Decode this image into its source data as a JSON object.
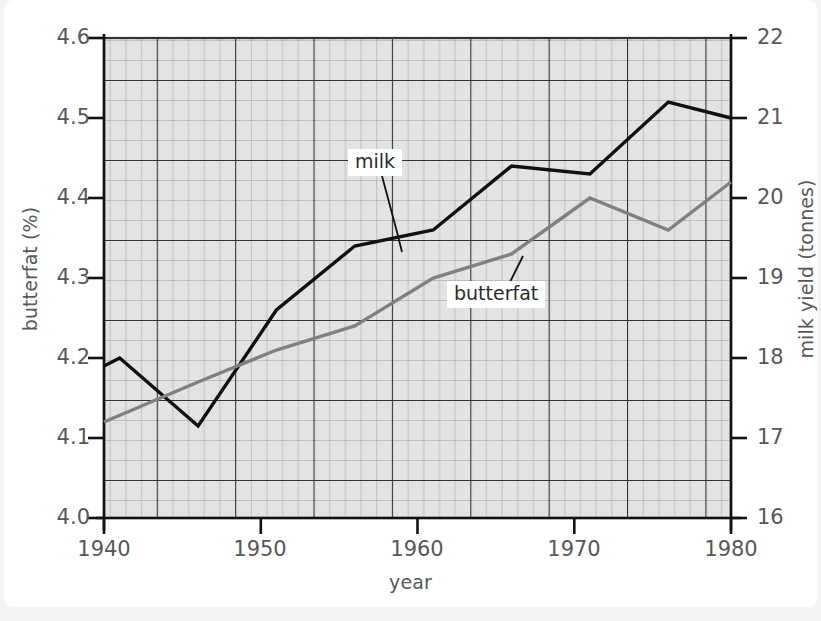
{
  "chart_data": {
    "type": "line",
    "title": "",
    "subtitle": "",
    "xlabel": "year",
    "ylabel": "butterfat (%)",
    "ylabel_right": "milk yield (tonnes)",
    "xlim": [
      1940,
      1980
    ],
    "ylim": [
      4.0,
      4.6
    ],
    "ylim_right": [
      16,
      22
    ],
    "grid": true,
    "grid_style": "graph-paper (major + minor)",
    "legend": "inline callout labels with leader lines",
    "xticks": [
      1940,
      1950,
      1960,
      1970,
      1980
    ],
    "xtick_labels": [
      "1940",
      "1950",
      "1960",
      "1970",
      "1980"
    ],
    "yticks": [
      4.0,
      4.1,
      4.2,
      4.3,
      4.4,
      4.5,
      4.6
    ],
    "ytick_labels": [
      "4.0",
      "4.1",
      "4.2",
      "4.3",
      "4.4",
      "4.5",
      "4.6"
    ],
    "yticks_right": [
      16,
      17,
      18,
      19,
      20,
      21,
      22
    ],
    "ytick_labels_right": [
      "16",
      "17",
      "18",
      "19",
      "20",
      "21",
      "22"
    ],
    "series": [
      {
        "name": "milk",
        "axis": "right",
        "unit": "tonnes",
        "color": "#111111",
        "x": [
          1940,
          1941,
          1946,
          1951,
          1956,
          1961,
          1966,
          1971,
          1976,
          1980
        ],
        "values": [
          17.9,
          18.0,
          17.15,
          18.6,
          19.4,
          19.6,
          20.4,
          20.3,
          21.2,
          21.0
        ]
      },
      {
        "name": "butterfat",
        "axis": "left",
        "unit": "%",
        "color": "#808080",
        "x": [
          1940,
          1946,
          1951,
          1956,
          1961,
          1966,
          1971,
          1976,
          1980
        ],
        "values": [
          4.12,
          4.17,
          4.21,
          4.24,
          4.3,
          4.33,
          4.4,
          4.36,
          4.42
        ]
      }
    ],
    "annotations": [
      {
        "text": "milk",
        "points_to_series": "milk"
      },
      {
        "text": "butterfat",
        "points_to_series": "butterfat"
      }
    ],
    "colors": {
      "page_background": "#f4f4f5",
      "card_background": "#ffffff",
      "plot_background": "#e3e3e3",
      "grid_major": "#333333",
      "grid_minor": "#9a9a9a",
      "axis": "#111111",
      "text": "#58585a",
      "milk_line": "#111111",
      "butterfat_line": "#808080"
    }
  }
}
